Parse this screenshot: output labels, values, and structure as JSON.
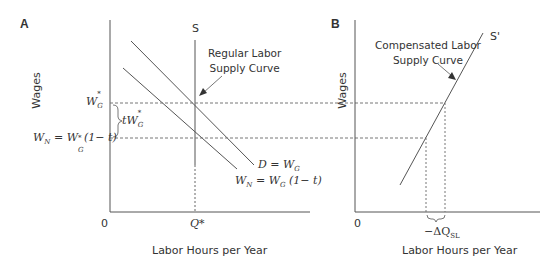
{
  "panel_a": {
    "label": "A",
    "y_axis_label": "Wages",
    "x_axis_label": "Labor Hours per Year",
    "origin_label": "0",
    "supply_label": "S",
    "annotation_line1": "Regular Labor",
    "annotation_line2": "Supply Curve",
    "wg_star_label": "W",
    "wg_star_sub": "G",
    "wg_star_sup": "*",
    "tax_wedge_label": "tW",
    "wn_label": "W",
    "wn_sub": "N",
    "wn_eq": " = W",
    "wn_eq_sub": "G",
    "wn_eq_sup": "*",
    "wn_eq_tail": "(1− t)",
    "q_star_label": "Q*",
    "demand_label_1": "D = W",
    "demand_label_sub": "G",
    "net_demand_label": "W",
    "net_demand_sub": "N",
    "net_demand_eq": " = W",
    "net_demand_eq_sub": "G",
    "net_demand_tail": " (1− t)"
  },
  "panel_b": {
    "label": "B",
    "y_axis_label": "Wages",
    "x_axis_label": "Labor Hours per Year",
    "origin_label": "0",
    "supply_label": "S'",
    "annotation_line1": "Compensated Labor",
    "annotation_line2": "Supply Curve",
    "delta_label": "−ΔQ",
    "delta_sub": "SL"
  },
  "colors": {
    "line": "#555555",
    "dash": "#777777",
    "text": "#333333"
  }
}
